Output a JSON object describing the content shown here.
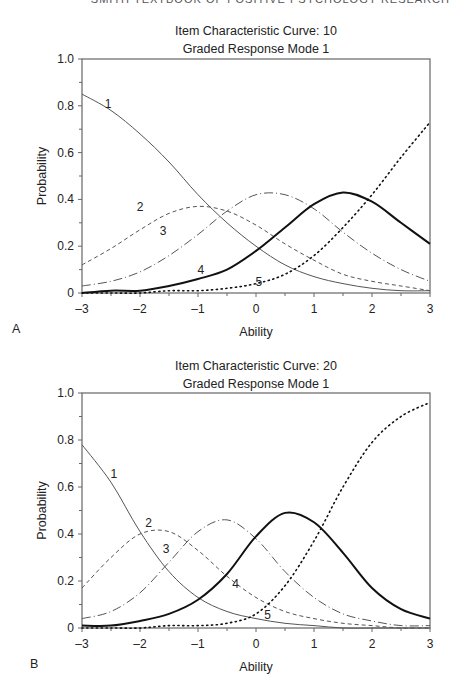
{
  "running_header": "SMITH TEXTBOOK OF POSITIVE PSYCHOLOGY RESEARCH",
  "panels": [
    {
      "letter": "A",
      "title_line1": "Item Characteristic Curve: 10",
      "title_line2": "Graded Response Mode 1"
    },
    {
      "letter": "B",
      "title_line1": "Item Characteristic Curve: 20",
      "title_line2": "Graded Response Mode 1"
    }
  ],
  "chart_data": [
    {
      "type": "line",
      "title": "Item Characteristic Curve: 10 — Graded Response Mode 1",
      "xlabel": "Ability",
      "ylabel": "Probability",
      "xlim": [
        -3,
        3
      ],
      "ylim": [
        0,
        1.0
      ],
      "xticks": [
        "-3",
        "-2",
        "-1",
        "0",
        "1",
        "2",
        "3"
      ],
      "yticks": [
        "0",
        "0.2",
        "0.4",
        "0.6",
        "0.8",
        "1.0"
      ],
      "grid": false,
      "legend": "inline curve labels 1-5",
      "x": [
        -3,
        -2.5,
        -2,
        -1.5,
        -1,
        -0.5,
        0,
        0.5,
        1,
        1.5,
        2,
        2.5,
        3
      ],
      "series": [
        {
          "name": "1",
          "style": "solid-thin",
          "label_pos": [
            -2.55,
            0.79
          ],
          "values": [
            0.85,
            0.78,
            0.68,
            0.56,
            0.42,
            0.3,
            0.2,
            0.12,
            0.07,
            0.04,
            0.02,
            0.01,
            0.01
          ]
        },
        {
          "name": "2",
          "style": "dashed",
          "label_pos": [
            -2.0,
            0.35
          ],
          "values": [
            0.12,
            0.19,
            0.27,
            0.34,
            0.37,
            0.35,
            0.29,
            0.21,
            0.14,
            0.08,
            0.05,
            0.03,
            0.01
          ]
        },
        {
          "name": "3",
          "style": "dash-dot",
          "label_pos": [
            -1.6,
            0.25
          ],
          "values": [
            0.03,
            0.05,
            0.09,
            0.16,
            0.25,
            0.35,
            0.42,
            0.42,
            0.36,
            0.26,
            0.17,
            0.1,
            0.05
          ]
        },
        {
          "name": "4",
          "style": "solid-thick",
          "label_pos": [
            -0.95,
            0.08
          ],
          "values": [
            0.0,
            0.01,
            0.01,
            0.03,
            0.06,
            0.1,
            0.18,
            0.28,
            0.38,
            0.43,
            0.39,
            0.3,
            0.21
          ]
        },
        {
          "name": "5",
          "style": "dotted",
          "label_pos": [
            0.05,
            0.03
          ],
          "values": [
            0.0,
            0.0,
            0.0,
            0.01,
            0.01,
            0.02,
            0.04,
            0.08,
            0.16,
            0.28,
            0.42,
            0.58,
            0.73
          ]
        }
      ]
    },
    {
      "type": "line",
      "title": "Item Characteristic Curve: 20 — Graded Response Mode 1",
      "xlabel": "Ability",
      "ylabel": "Probability",
      "xlim": [
        -3,
        3
      ],
      "ylim": [
        0,
        1.0
      ],
      "xticks": [
        "-3",
        "-2",
        "-1",
        "0",
        "1",
        "2",
        "3"
      ],
      "yticks": [
        "0",
        "0.2",
        "0.4",
        "0.6",
        "0.8",
        "1.0"
      ],
      "grid": false,
      "legend": "inline curve labels 1-5",
      "x": [
        -3,
        -2.5,
        -2,
        -1.5,
        -1,
        -0.5,
        0,
        0.5,
        1,
        1.5,
        2,
        2.5,
        3
      ],
      "series": [
        {
          "name": "1",
          "style": "solid-thin",
          "label_pos": [
            -2.45,
            0.64
          ],
          "values": [
            0.78,
            0.62,
            0.41,
            0.24,
            0.13,
            0.07,
            0.04,
            0.02,
            0.01,
            0.0,
            0.0,
            0.0,
            0.0
          ]
        },
        {
          "name": "2",
          "style": "dashed",
          "label_pos": [
            -1.85,
            0.43
          ],
          "values": [
            0.17,
            0.3,
            0.4,
            0.41,
            0.33,
            0.22,
            0.13,
            0.07,
            0.04,
            0.02,
            0.01,
            0.0,
            0.0
          ]
        },
        {
          "name": "3",
          "style": "dash-dot",
          "label_pos": [
            -1.55,
            0.32
          ],
          "values": [
            0.04,
            0.07,
            0.15,
            0.28,
            0.41,
            0.46,
            0.38,
            0.24,
            0.13,
            0.06,
            0.03,
            0.01,
            0.01
          ]
        },
        {
          "name": "4",
          "style": "solid-thick",
          "label_pos": [
            -0.35,
            0.17
          ],
          "values": [
            0.01,
            0.01,
            0.03,
            0.06,
            0.12,
            0.23,
            0.39,
            0.49,
            0.45,
            0.32,
            0.17,
            0.08,
            0.04
          ]
        },
        {
          "name": "5",
          "style": "dotted",
          "label_pos": [
            0.2,
            0.04
          ],
          "values": [
            0.0,
            0.0,
            0.0,
            0.01,
            0.01,
            0.02,
            0.06,
            0.18,
            0.37,
            0.6,
            0.79,
            0.9,
            0.96
          ]
        }
      ]
    }
  ]
}
